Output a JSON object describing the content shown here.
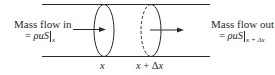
{
  "diagram": {
    "type": "control-volume-mass-flow",
    "inflow": {
      "label": "Mass flow in",
      "eq_prefix": "= ",
      "expression": "ρuS",
      "subscript": "x"
    },
    "outflow": {
      "label": "Mass flow out",
      "eq_prefix": "= ",
      "expression": "ρuS",
      "subscript": "x + Δx"
    },
    "positions": {
      "left": "x",
      "right_var": "x",
      "right_op": " + ",
      "right_delta": "Δ",
      "right_var2": "x"
    },
    "colors": {
      "line": "#2a2a2a",
      "background": "#ffffff"
    }
  }
}
